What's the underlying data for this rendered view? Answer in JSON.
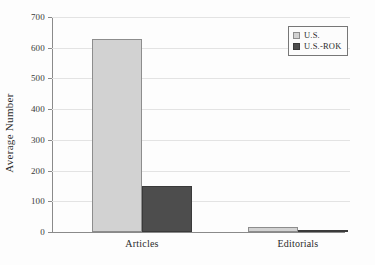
{
  "chart_data": {
    "type": "bar",
    "title": "",
    "subtitle": "",
    "xlabel": "",
    "ylabel": "Average Number",
    "categories": [
      "Articles",
      "Editorials"
    ],
    "series": [
      {
        "name": "U.S.",
        "values": [
          628,
          15
        ],
        "color": "#d2d2d2"
      },
      {
        "name": "U.S.-ROK",
        "values": [
          150,
          4
        ],
        "color": "#4d4d4d"
      }
    ],
    "ylim": [
      0,
      700
    ],
    "ytick_labels": [
      "700",
      "600",
      "500",
      "400",
      "300",
      "200",
      "100",
      "0"
    ],
    "ytick_values": [
      700,
      600,
      500,
      400,
      300,
      200,
      100,
      0
    ],
    "grid": "horizontal",
    "legend_position": "top-right",
    "legend_entries": [
      "U.S.",
      "U.S.-ROK"
    ],
    "annotations": []
  }
}
